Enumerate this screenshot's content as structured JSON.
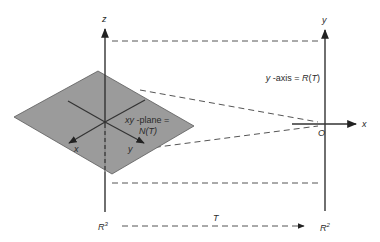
{
  "diagram": {
    "left_space": {
      "name": "R",
      "exponent": "3",
      "axis_labels": {
        "z": "z",
        "x": "x",
        "y": "y"
      },
      "plane_label_line1": "xy-plane =",
      "plane_label_line2": "N(T)"
    },
    "right_space": {
      "name": "R",
      "exponent": "2",
      "axis_labels": {
        "y": "y",
        "x": "x"
      },
      "origin_label": "O",
      "axis_note": "y-axis = R(T)"
    },
    "mapping": {
      "label": "T"
    },
    "colors": {
      "plane_fill": "#9b9b9b",
      "line": "#333333"
    }
  }
}
